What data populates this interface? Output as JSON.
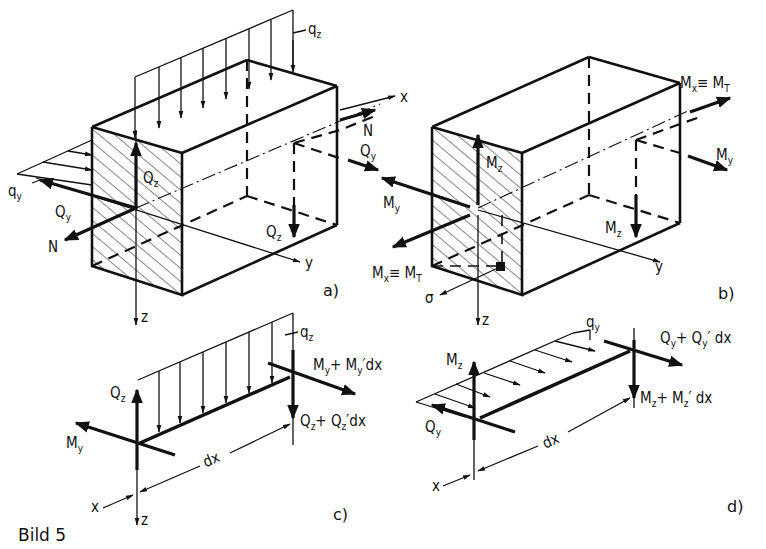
{
  "figure": {
    "caption": "Bild 5",
    "panels": {
      "a": {
        "label": "a)",
        "description": "Beam element with internal forces",
        "labels": {
          "qz": "q",
          "qz_sub": "z",
          "qy": "q",
          "qy_sub": "y",
          "Qy_left": "Q",
          "Qy_left_sub": "y",
          "Qz_left": "Q",
          "Qz_left_sub": "z",
          "N_left": "N",
          "N_right": "N",
          "Qy_right": "Q",
          "Qy_right_sub": "y",
          "Qz_right": "Q",
          "Qz_right_sub": "z",
          "axis_x": "x",
          "axis_y": "y",
          "axis_z": "z"
        }
      },
      "b": {
        "label": "b)",
        "description": "Beam element with internal moments",
        "labels": {
          "Mz_left": "M",
          "Mz_left_sub": "z",
          "My_left": "M",
          "My_left_sub": "y",
          "MxMT_left": "M",
          "MxMT_left_sub": "x",
          "MxMT_left_eq": "≡ M",
          "MxMT_left_sub2": "T",
          "sigma": "σ",
          "MxMT_right": "M",
          "MxMT_right_sub": "x",
          "MxMT_right_eq": "≡ M",
          "MxMT_right_sub2": "T",
          "My_right": "M",
          "My_right_sub": "y",
          "Mz_right": "M",
          "Mz_right_sub": "z",
          "axis_y": "y",
          "axis_z": "z"
        }
      },
      "c": {
        "label": "c)",
        "labels": {
          "qz": "q",
          "qz_sub": "z",
          "Qz": "Q",
          "Qz_sub": "z",
          "My": "M",
          "My_sub": "y",
          "My_plus": "M",
          "My_plus_sub": "y",
          "My_plus_rest": "+ M",
          "My_plus_sub2": "y",
          "My_plus_tail": "′dx",
          "Qz_plus": "Q",
          "Qz_plus_sub": "z",
          "Qz_plus_rest": "+ Q",
          "Qz_plus_sub2": "z",
          "Qz_plus_tail": "′dx",
          "dx": "dx",
          "axis_x": "x",
          "axis_z": "z"
        }
      },
      "d": {
        "label": "d)",
        "labels": {
          "qy": "q",
          "qy_sub": "y",
          "Mz": "M",
          "Mz_sub": "z",
          "Qy": "Q",
          "Qy_sub": "y",
          "Qy_plus": "Q",
          "Qy_plus_sub": "y",
          "Qy_plus_rest": "+ Q",
          "Qy_plus_sub2": "y",
          "Qy_plus_tail": "′ dx",
          "Mz_plus": "M",
          "Mz_plus_sub": "z",
          "Mz_plus_rest": "+ M",
          "Mz_plus_sub2": "z",
          "Mz_plus_tail": "′ dx",
          "dx": "dx",
          "axis_x": "x"
        }
      }
    }
  }
}
